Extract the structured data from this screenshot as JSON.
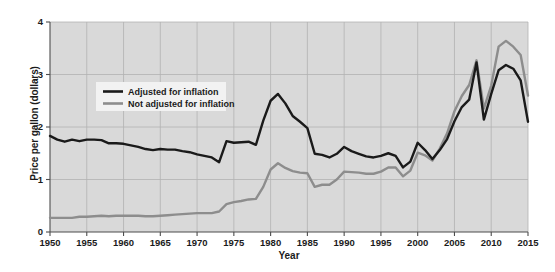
{
  "chart_data": {
    "type": "line",
    "title": "",
    "xlabel": "Year",
    "ylabel": "Price per gallon (dollars)",
    "xlim": [
      1950,
      2015
    ],
    "ylim": [
      0,
      4
    ],
    "xticks": [
      1950,
      1955,
      1960,
      1965,
      1970,
      1975,
      1980,
      1985,
      1990,
      1995,
      2000,
      2005,
      2010,
      2015
    ],
    "yticks": [
      0,
      1,
      2,
      3,
      4
    ],
    "grid": true,
    "legend_position": "upper-left",
    "plot_background": "#d9d9d9",
    "grid_color": "#b3b3b3",
    "x": [
      1950,
      1951,
      1952,
      1953,
      1954,
      1955,
      1956,
      1957,
      1958,
      1959,
      1960,
      1961,
      1962,
      1963,
      1964,
      1965,
      1966,
      1967,
      1968,
      1969,
      1970,
      1971,
      1972,
      1973,
      1974,
      1975,
      1976,
      1977,
      1978,
      1979,
      1980,
      1981,
      1982,
      1983,
      1984,
      1985,
      1986,
      1987,
      1988,
      1989,
      1990,
      1991,
      1992,
      1993,
      1994,
      1995,
      1996,
      1997,
      1998,
      1999,
      2000,
      2001,
      2002,
      2003,
      2004,
      2005,
      2006,
      2007,
      2008,
      2009,
      2010,
      2011,
      2012,
      2013,
      2014,
      2015
    ],
    "series": [
      {
        "name": "Adjusted for inflation",
        "color": "#1a1a1a",
        "values": [
          1.83,
          1.76,
          1.72,
          1.76,
          1.73,
          1.76,
          1.76,
          1.75,
          1.69,
          1.69,
          1.68,
          1.65,
          1.62,
          1.58,
          1.56,
          1.58,
          1.57,
          1.57,
          1.54,
          1.52,
          1.48,
          1.45,
          1.42,
          1.33,
          1.73,
          1.7,
          1.71,
          1.72,
          1.66,
          2.12,
          2.5,
          2.63,
          2.45,
          2.21,
          2.1,
          1.98,
          1.49,
          1.47,
          1.42,
          1.49,
          1.62,
          1.54,
          1.49,
          1.44,
          1.42,
          1.45,
          1.5,
          1.45,
          1.23,
          1.34,
          1.7,
          1.56,
          1.39,
          1.56,
          1.77,
          2.11,
          2.38,
          2.52,
          3.23,
          2.14,
          2.63,
          3.08,
          3.18,
          3.11,
          2.89,
          2.1
        ]
      },
      {
        "name": "Not adjusted for inflation",
        "color": "#8d8d8d",
        "values": [
          0.27,
          0.27,
          0.27,
          0.27,
          0.29,
          0.29,
          0.3,
          0.31,
          0.3,
          0.31,
          0.31,
          0.31,
          0.31,
          0.3,
          0.3,
          0.31,
          0.32,
          0.33,
          0.34,
          0.35,
          0.36,
          0.36,
          0.36,
          0.39,
          0.53,
          0.57,
          0.59,
          0.62,
          0.63,
          0.86,
          1.19,
          1.31,
          1.22,
          1.16,
          1.13,
          1.12,
          0.86,
          0.9,
          0.9,
          1.0,
          1.15,
          1.14,
          1.13,
          1.11,
          1.11,
          1.15,
          1.23,
          1.23,
          1.06,
          1.17,
          1.51,
          1.46,
          1.36,
          1.59,
          1.88,
          2.3,
          2.59,
          2.8,
          3.27,
          2.35,
          2.79,
          3.53,
          3.64,
          3.53,
          3.37,
          2.6
        ]
      }
    ]
  },
  "legend": {
    "items": [
      {
        "label": "Adjusted for inflation",
        "color": "#1a1a1a"
      },
      {
        "label": "Not adjusted for inflation",
        "color": "#8d8d8d"
      }
    ]
  },
  "axes": {
    "y_title": "Price per gallon (dollars)",
    "x_title": "Year"
  }
}
